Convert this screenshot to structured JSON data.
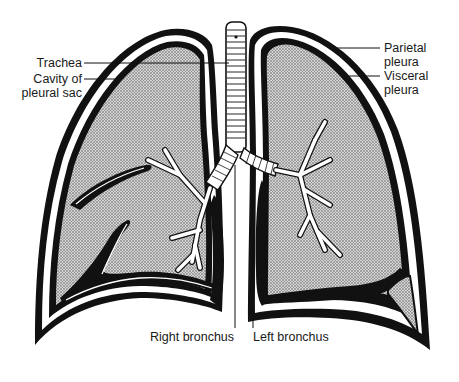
{
  "diagram": {
    "labels": {
      "trachea": "Trachea",
      "cavity_line1": "Cavity of",
      "cavity_line2": "pleural sac",
      "parietal_line1": "Parietal",
      "parietal_line2": "pleura",
      "visceral_line1": "Visceral",
      "visceral_line2": "pleura",
      "right_bronchus": "Right bronchus",
      "left_bronchus": "Left bronchus"
    },
    "colors": {
      "outline": "#111111",
      "lung_fill": "#b8b8b8",
      "background": "#ffffff",
      "airway": "#ffffff"
    }
  }
}
